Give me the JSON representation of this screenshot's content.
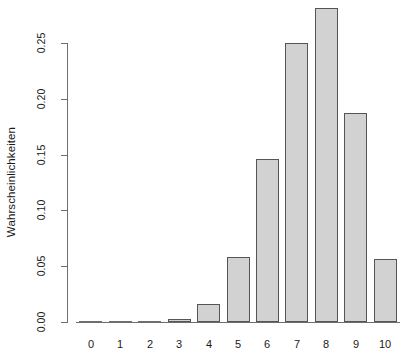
{
  "chart_data": {
    "type": "bar",
    "title": "",
    "subtitle": "",
    "xlabel": "",
    "ylabel": "Wahrscheinlichkeiten",
    "categories": [
      "0",
      "1",
      "2",
      "3",
      "4",
      "5",
      "6",
      "7",
      "8",
      "9",
      "10"
    ],
    "values": [
      0.0,
      0.0,
      0.0004,
      0.0031,
      0.0162,
      0.0584,
      0.146,
      0.2503,
      0.2816,
      0.1877,
      0.0563
    ],
    "series": [
      {
        "name": "Wahrscheinlichkeiten",
        "values": [
          0.0,
          0.0,
          0.0004,
          0.0031,
          0.0162,
          0.0584,
          0.146,
          0.2503,
          0.2816,
          0.1877,
          0.0563
        ]
      }
    ],
    "ylim": [
      0.0,
      0.2816
    ],
    "yticks": [
      0.0,
      0.05,
      0.1,
      0.15,
      0.2,
      0.25
    ],
    "ytick_labels": [
      "0.00",
      "0.05",
      "0.10",
      "0.15",
      "0.20",
      "0.25"
    ],
    "xtick_labels": [
      "0",
      "1",
      "2",
      "3",
      "4",
      "5",
      "6",
      "7",
      "8",
      "9",
      "10"
    ],
    "grid": false,
    "legend": false,
    "legend_position": "none",
    "bar_fill_color": "#d2d2d2",
    "bar_border_color": "#555555",
    "axis_color": "#6e6e6e",
    "background_color": "#ffffff",
    "annotations": []
  },
  "axes": {
    "y_axis_name": "y-axis",
    "x_axis_name": "x-axis"
  }
}
